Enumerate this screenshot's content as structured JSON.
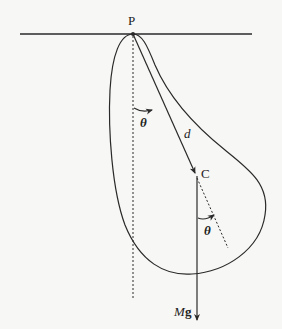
{
  "diagram": {
    "labels": {
      "pivot": "P",
      "center_of_mass": "C",
      "distance": "d",
      "angle_top": "θ",
      "angle_bottom": "θ",
      "weight_M": "M",
      "weight_g": "g"
    },
    "colors": {
      "stroke": "#2a2a2a",
      "background": "#f7f7f5"
    }
  }
}
